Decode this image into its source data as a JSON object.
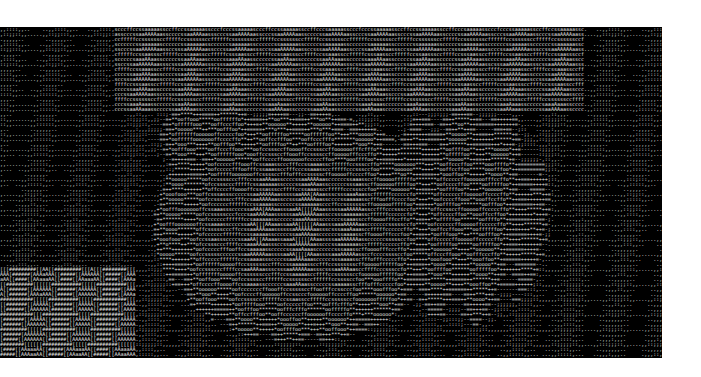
{
  "canvas": {
    "width": 701,
    "height": 377,
    "background": "#ffffff"
  },
  "art": {
    "left": 0,
    "top": 27,
    "width": 662,
    "height": 331,
    "rows": 66,
    "cols": 220,
    "background": "#000000",
    "foreground": "#e8e8e8",
    "ramp": " .,:;-=+*ofcsaA[#",
    "description": "ASCII-art rendering of a portrait (hat brim at top, face with eye regions and nose/mouth, bright left edge at bottom)"
  },
  "regions": [
    {
      "name": "hat-band",
      "x0": 0.17,
      "x1": 0.88,
      "y0": 0.0,
      "y1": 0.25,
      "level": 0.75
    },
    {
      "name": "left-dark-edge",
      "x0": 0.0,
      "x1": 0.17,
      "y0": 0.0,
      "y1": 0.5,
      "level": 0.12
    },
    {
      "name": "right-dark-edge",
      "x0": 0.88,
      "x1": 1.0,
      "y0": 0.0,
      "y1": 1.0,
      "level": 0.12
    },
    {
      "name": "left-eye-bright",
      "cx": 0.32,
      "cy": 0.32,
      "rx": 0.1,
      "ry": 0.12,
      "level": 0.6
    },
    {
      "name": "center-face",
      "cx": 0.45,
      "cy": 0.6,
      "rx": 0.22,
      "ry": 0.35,
      "level": 0.8
    },
    {
      "name": "right-face",
      "cx": 0.7,
      "cy": 0.55,
      "rx": 0.13,
      "ry": 0.35,
      "level": 0.6
    },
    {
      "name": "bottom-left-bright",
      "x0": 0.0,
      "x1": 0.2,
      "y0": 0.72,
      "y1": 1.0,
      "level": 0.95
    }
  ]
}
